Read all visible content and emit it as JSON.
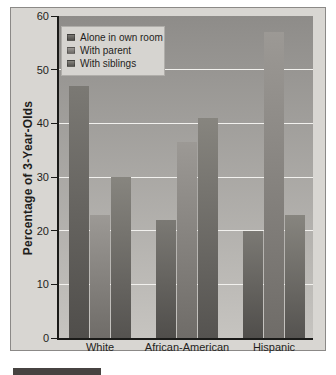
{
  "colors": {
    "page_bg": "#ffffff",
    "panel_bg": "#d8d6d2",
    "panel_border": "#8b8987",
    "plot_top": "#8e8c89",
    "plot_bottom": "#c6c4c0",
    "gridline": "#f2f1ee",
    "axis": "#1a1a18",
    "text": "#1f1e1c",
    "legend_bg": "#d6d4d0",
    "legend_border": "#b0aeaa",
    "banner": "#474341"
  },
  "chart_data": {
    "type": "bar",
    "title": "",
    "xlabel": "",
    "ylabel": "Percentage of 3-Year-Olds",
    "ylim": [
      0,
      60
    ],
    "yticks": [
      0,
      10,
      20,
      30,
      40,
      50,
      60
    ],
    "grid": true,
    "legend_position": "top-left",
    "categories": [
      "White",
      "African-American",
      "Hispanic"
    ],
    "series": [
      {
        "name": "Alone in own room",
        "values": [
          47,
          22,
          20
        ],
        "color_top": "#7b7974",
        "color_bottom": "#504e4b"
      },
      {
        "name": "With parent",
        "values": [
          23,
          36.5,
          57
        ],
        "color_top": "#9c9995",
        "color_bottom": "#6f6c68"
      },
      {
        "name": "With siblings",
        "values": [
          30,
          41,
          23
        ],
        "color_top": "#87857f",
        "color_bottom": "#555350"
      }
    ]
  }
}
